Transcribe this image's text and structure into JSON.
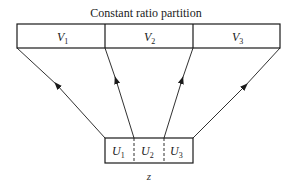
{
  "diagram": {
    "title": "Constant ratio partition",
    "top_partitions": [
      {
        "base": "V",
        "sub": "1"
      },
      {
        "base": "V",
        "sub": "2"
      },
      {
        "base": "V",
        "sub": "3"
      }
    ],
    "bottom_partitions": [
      {
        "base": "U",
        "sub": "1"
      },
      {
        "base": "U",
        "sub": "2"
      },
      {
        "base": "U",
        "sub": "3"
      }
    ],
    "bottom_label": "z",
    "colors": {
      "stroke": "#1a1a1a",
      "background": "#ffffff"
    }
  }
}
